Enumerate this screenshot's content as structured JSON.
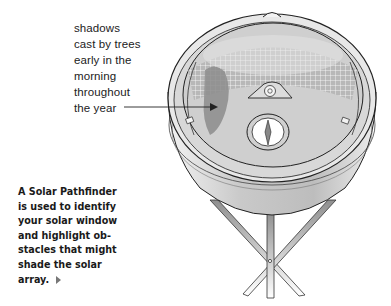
{
  "callout": {
    "lines": [
      "shadows",
      "cast by trees",
      "early in the",
      "morning",
      "throughout",
      "the year"
    ]
  },
  "caption": {
    "lines": [
      "A Solar Pathfinder",
      "is used to identify",
      "your solar window",
      "and highlight ob-",
      "stacles that might",
      "shade the solar",
      "array."
    ],
    "end_marker": "triangle-right"
  },
  "illustration": {
    "subject": "Solar Pathfinder on tripod",
    "parts": [
      "dome",
      "sun-path-grid",
      "tree-shadow-reflection",
      "level-bubble",
      "compass",
      "base",
      "tripod-legs"
    ],
    "colors": {
      "outline": "#222222",
      "dome": "#d9d9d9",
      "shadow": "#8c8c8c",
      "base": "#c8c8c8",
      "legs": "#9a9a9a"
    }
  }
}
